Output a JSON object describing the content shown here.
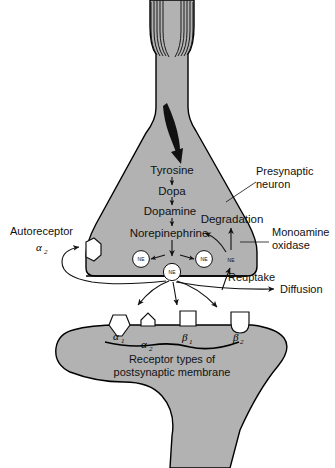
{
  "figure": {
    "colors": {
      "cell_fill": "#b2b2b2",
      "outline": "#000000",
      "background": "#ffffff",
      "text": "#111111"
    }
  },
  "pathway": {
    "steps": [
      {
        "label": "Tyrosine"
      },
      {
        "label": "Dopa"
      },
      {
        "label": "Dopamine"
      },
      {
        "label": "Norepinephrine"
      }
    ]
  },
  "presynaptic": {
    "neuron_label_line1": "Presynaptic",
    "neuron_label_line2": "neuron",
    "degradation_label": "Degradation",
    "monoamine_oxidase_line1": "Monoamine",
    "monoamine_oxidase_line2": "oxidase",
    "reuptake_label": "Reuptake",
    "diffusion_label": "Diffusion",
    "autoreceptor_label": "Autoreceptor",
    "autoreceptor_subtype": "α",
    "autoreceptor_subtype_sub": "2",
    "vesicles": [
      {
        "label": "NE"
      },
      {
        "label": "NE"
      },
      {
        "label": "NE"
      },
      {
        "label": "NE"
      }
    ]
  },
  "postsynaptic": {
    "caption_line1": "Receptor types of",
    "caption_line2": "postsynaptic membrane",
    "receptors": [
      {
        "greek": "α",
        "sub": "1",
        "shape": "v-notch"
      },
      {
        "greek": "α",
        "sub": "2",
        "shape": "pentagon-bump"
      },
      {
        "greek": "β",
        "sub": "1",
        "shape": "square-bump"
      },
      {
        "greek": "β",
        "sub": "2",
        "shape": "u-notch"
      }
    ]
  }
}
